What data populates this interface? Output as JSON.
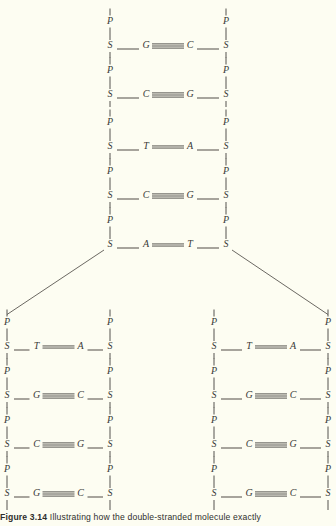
{
  "figure": {
    "label": "Figure 3.14",
    "caption_text": "Illustrating how the double-stranded molecule exactly",
    "background_color": "#fdfdf2",
    "ink_color": "#3a3a38"
  },
  "legend": {
    "phosphate_symbol": "P",
    "sugar_symbol": "S"
  },
  "parent_strand": {
    "name": "parent-double-stranded-molecule",
    "left_backbone_x": 110,
    "right_backbone_x": 226,
    "rungs": [
      {
        "left_base": "G",
        "right_base": "C",
        "bonds": 3,
        "y": 46
      },
      {
        "left_base": "C",
        "right_base": "G",
        "bonds": 3,
        "y": 95
      },
      {
        "left_base": "T",
        "right_base": "A",
        "bonds": 2,
        "y": 147
      },
      {
        "left_base": "C",
        "right_base": "G",
        "bonds": 3,
        "y": 196
      },
      {
        "left_base": "A",
        "right_base": "T",
        "bonds": 2,
        "y": 245
      }
    ]
  },
  "daughter_left": {
    "name": "daughter-strand-left",
    "left_backbone_x": 7,
    "right_backbone_x": 110,
    "rungs": [
      {
        "left_base": "T",
        "right_base": "A",
        "bonds": 2,
        "y": 347
      },
      {
        "left_base": "G",
        "right_base": "C",
        "bonds": 3,
        "y": 396
      },
      {
        "left_base": "C",
        "right_base": "G",
        "bonds": 3,
        "y": 445
      },
      {
        "left_base": "G",
        "right_base": "C",
        "bonds": 3,
        "y": 494
      }
    ]
  },
  "daughter_right": {
    "name": "daughter-strand-right",
    "left_backbone_x": 214,
    "right_backbone_x": 328,
    "rungs": [
      {
        "left_base": "T",
        "right_base": "A",
        "bonds": 2,
        "y": 347
      },
      {
        "left_base": "G",
        "right_base": "C",
        "bonds": 3,
        "y": 396
      },
      {
        "left_base": "C",
        "right_base": "G",
        "bonds": 3,
        "y": 445
      },
      {
        "left_base": "G",
        "right_base": "C",
        "bonds": 3,
        "y": 494
      }
    ]
  }
}
